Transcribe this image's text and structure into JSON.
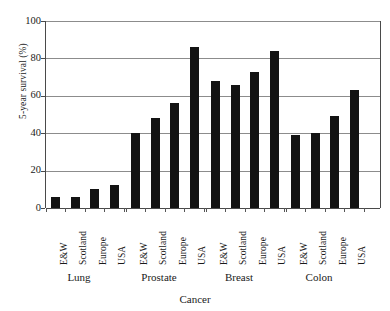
{
  "chart_data": {
    "type": "bar",
    "title": "",
    "subtitle": "",
    "xlabel": "Cancer",
    "ylabel": "5-year survival (%)",
    "ylim": [
      0,
      100
    ],
    "yticks": [
      0,
      20,
      40,
      60,
      80,
      100
    ],
    "ytick_labels": [
      "0",
      "20",
      "40",
      "60",
      "80",
      "100"
    ],
    "grid": true,
    "grid_axis": "y",
    "legend": false,
    "legend_position": "none",
    "bar_color": "#131313",
    "groups": [
      "Lung",
      "Prostate",
      "Breast",
      "Colon"
    ],
    "categories": [
      "E&W",
      "Scotland",
      "Europe",
      "USA"
    ],
    "series": [
      {
        "name": "E&W",
        "values": [
          6,
          40,
          68,
          39
        ]
      },
      {
        "name": "Scotland",
        "values": [
          6,
          48,
          66,
          40
        ]
      },
      {
        "name": "Europe",
        "values": [
          10,
          56,
          73,
          49
        ]
      },
      {
        "name": "USA",
        "values": [
          12.5,
          86,
          84,
          63
        ]
      }
    ],
    "bars": [
      {
        "group": "Lung",
        "category": "E&W",
        "value": 6
      },
      {
        "group": "Lung",
        "category": "Scotland",
        "value": 6
      },
      {
        "group": "Lung",
        "category": "Europe",
        "value": 10
      },
      {
        "group": "Lung",
        "category": "USA",
        "value": 12.5
      },
      {
        "group": "Prostate",
        "category": "E&W",
        "value": 40
      },
      {
        "group": "Prostate",
        "category": "Scotland",
        "value": 48
      },
      {
        "group": "Prostate",
        "category": "Europe",
        "value": 56
      },
      {
        "group": "Prostate",
        "category": "USA",
        "value": 86
      },
      {
        "group": "Breast",
        "category": "E&W",
        "value": 68
      },
      {
        "group": "Breast",
        "category": "Scotland",
        "value": 66
      },
      {
        "group": "Breast",
        "category": "Europe",
        "value": 73
      },
      {
        "group": "Breast",
        "category": "USA",
        "value": 84
      },
      {
        "group": "Colon",
        "category": "E&W",
        "value": 39
      },
      {
        "group": "Colon",
        "category": "Scotland",
        "value": 40
      },
      {
        "group": "Colon",
        "category": "Europe",
        "value": 49
      },
      {
        "group": "Colon",
        "category": "USA",
        "value": 63
      }
    ]
  }
}
